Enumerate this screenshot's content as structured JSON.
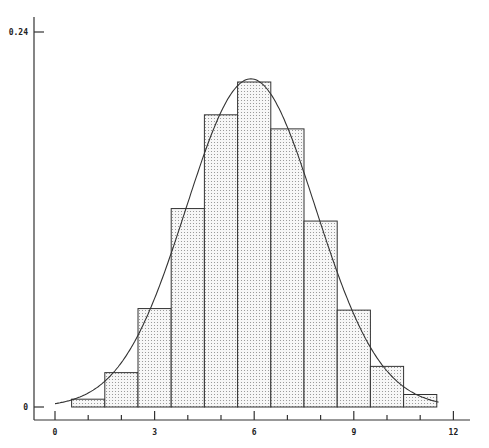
{
  "chart_data": {
    "type": "bar",
    "title": "",
    "xlabel": "",
    "ylabel": "",
    "categories": [
      1,
      2,
      3,
      4,
      5,
      6,
      7,
      8,
      9,
      10,
      11
    ],
    "values": [
      0.005,
      0.022,
      0.063,
      0.127,
      0.187,
      0.208,
      0.178,
      0.119,
      0.062,
      0.026,
      0.008
    ],
    "overlay_curve": {
      "type": "normal",
      "mean": 5.9,
      "sd": 1.95,
      "peak": 0.21
    },
    "xlim": [
      0,
      12
    ],
    "ylim": [
      0,
      0.24
    ],
    "x_ticks": [
      "0",
      "3",
      "6",
      "9",
      "12"
    ],
    "x_tick_values": [
      0,
      3,
      6,
      9,
      12
    ],
    "y_ticks": [
      "0",
      "0.24"
    ],
    "y_tick_values": [
      0,
      0.24
    ],
    "grid": false,
    "legend": null,
    "bar_fill": "dotted",
    "colors": {
      "line": "#333333",
      "fill_dots": "#888888"
    }
  }
}
